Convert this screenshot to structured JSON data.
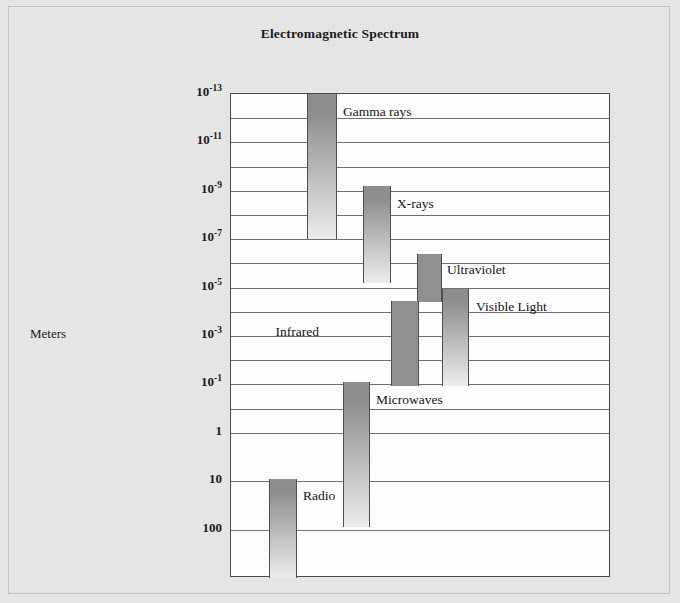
{
  "chart_data": {
    "type": "bar",
    "title": "Electromagnetic Spectrum",
    "xlabel": "",
    "ylabel": "Meters",
    "orientation": "vertical-wavelength-scale",
    "grid": true,
    "legend_position": "inline-labels",
    "y_axis_ticks": [
      {
        "mantissa": "10",
        "exponent": "-13"
      },
      {
        "mantissa": "10",
        "exponent": "-11"
      },
      {
        "mantissa": "10",
        "exponent": "-9"
      },
      {
        "mantissa": "10",
        "exponent": "-7"
      },
      {
        "mantissa": "10",
        "exponent": "-5"
      },
      {
        "mantissa": "10",
        "exponent": "-3"
      },
      {
        "mantissa": "10",
        "exponent": "-1"
      },
      {
        "mantissa": "1",
        "exponent": ""
      },
      {
        "mantissa": "10",
        "exponent": ""
      },
      {
        "mantissa": "100",
        "exponent": ""
      }
    ],
    "ylim": [
      "1e-14",
      "1e3"
    ],
    "bands": [
      {
        "name": "Gamma rays",
        "wavelength_top_m": "1e-13",
        "wavelength_bottom_m": "1e-10",
        "label_side": "right"
      },
      {
        "name": "X-rays",
        "wavelength_top_m": "1e-10",
        "wavelength_bottom_m": "1e-8",
        "label_side": "right"
      },
      {
        "name": "Ultraviolet",
        "wavelength_top_m": "1e-8",
        "wavelength_bottom_m": "4e-7",
        "label_side": "right"
      },
      {
        "name": "Visible Light",
        "wavelength_top_m": "4e-7",
        "wavelength_bottom_m": "7e-7",
        "label_side": "right"
      },
      {
        "name": "Infrared",
        "wavelength_top_m": "7e-7",
        "wavelength_bottom_m": "1e-4",
        "label_side": "left"
      },
      {
        "name": "Microwaves",
        "wavelength_top_m": "1e-4",
        "wavelength_bottom_m": "1e-1",
        "label_side": "right"
      },
      {
        "name": "Radio",
        "wavelength_top_m": "1e-1",
        "wavelength_bottom_m": "1e3",
        "label_side": "right"
      }
    ]
  },
  "colors": {
    "band_gradient_top": "#8d8d8d",
    "band_gradient_bottom": "#ededed",
    "band_solid": "#8f8f8f",
    "frame": "#4a4a4a",
    "gridline": "#6f6f6f",
    "paper": "#e9e9e9",
    "plot_background": "#fdfdfd"
  }
}
